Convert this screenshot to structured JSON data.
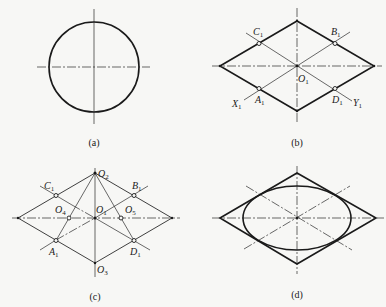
{
  "figure": {
    "panels": [
      {
        "id": "a",
        "caption": "(a)",
        "content": "circle with horizontal and vertical center lines"
      },
      {
        "id": "b",
        "caption": "(b)",
        "content": "rhombus with axes and diagonals through tangent points",
        "labels": {
          "C1": {
            "base": "C",
            "sub": "1"
          },
          "B1": {
            "base": "B",
            "sub": "1"
          },
          "O1": {
            "base": "O",
            "sub": "1"
          },
          "A1": {
            "base": "A",
            "sub": "1"
          },
          "D1": {
            "base": "D",
            "sub": "1"
          },
          "X1": {
            "base": "X",
            "sub": "1"
          },
          "Y1": {
            "base": "Y",
            "sub": "1"
          }
        }
      },
      {
        "id": "c",
        "caption": "(c)",
        "content": "locating the four arc centers O2, O3, O4, O5",
        "labels": {
          "O2": {
            "base": "O",
            "sub": "2"
          },
          "C1": {
            "base": "C",
            "sub": "1"
          },
          "B1": {
            "base": "B",
            "sub": "1"
          },
          "O1": {
            "base": "O",
            "sub": "1"
          },
          "O4": {
            "base": "O",
            "sub": "4"
          },
          "O5": {
            "base": "O",
            "sub": "5"
          },
          "A1": {
            "base": "A",
            "sub": "1"
          },
          "D1": {
            "base": "D",
            "sub": "1"
          },
          "O3": {
            "base": "O",
            "sub": "3"
          }
        }
      },
      {
        "id": "d",
        "caption": "(d)",
        "content": "completed approximate ellipse inscribed in rhombus"
      }
    ]
  }
}
